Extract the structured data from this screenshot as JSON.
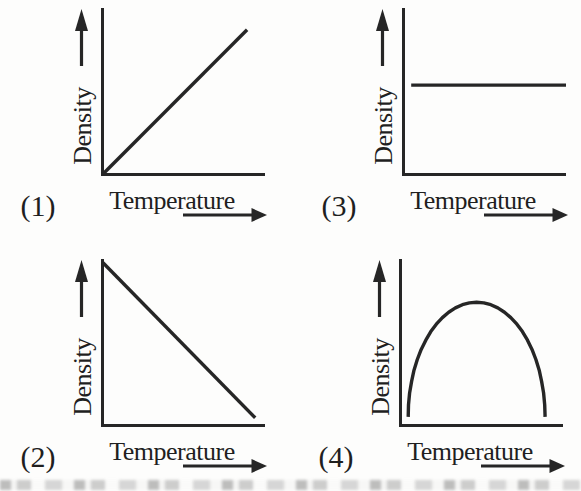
{
  "figure": {
    "title": "",
    "ink_color": "#262626",
    "paper_color": "#fdfdfc",
    "axes_have_tick_labels": false
  },
  "chart_data": [
    {
      "id": 1,
      "label": "(1)",
      "type": "line",
      "xlabel": "Temperature",
      "ylabel": "Density",
      "trend": "linear increasing from origin",
      "x_range": [
        0,
        1
      ],
      "y_range": [
        0,
        1
      ],
      "points": [
        [
          0.006,
          0.006
        ],
        [
          0.89,
          0.88
        ]
      ]
    },
    {
      "id": 2,
      "label": "(2)",
      "type": "line",
      "xlabel": "Temperature",
      "ylabel": "Density",
      "trend": "linear decreasing from maximum at left",
      "x_range": [
        0,
        1
      ],
      "y_range": [
        0,
        1
      ],
      "points": [
        [
          0.006,
          0.99
        ],
        [
          0.94,
          0.05
        ]
      ]
    },
    {
      "id": 3,
      "label": "(3)",
      "type": "line",
      "xlabel": "Temperature",
      "ylabel": "Density",
      "trend": "constant (horizontal line)",
      "x_range": [
        0,
        1
      ],
      "y_range": [
        0,
        1
      ],
      "points": [
        [
          0.05,
          0.545
        ],
        [
          1.0,
          0.545
        ]
      ]
    },
    {
      "id": 4,
      "label": "(4)",
      "type": "line",
      "xlabel": "Temperature",
      "ylabel": "Density",
      "trend": "rises to a maximum then falls (dome / semi-ellipse)",
      "x_range": [
        0,
        1
      ],
      "y_range": [
        0,
        1
      ],
      "points": [
        [
          0.05,
          0.055
        ],
        [
          0.052,
          0.128
        ],
        [
          0.059,
          0.2
        ],
        [
          0.071,
          0.27
        ],
        [
          0.086,
          0.338
        ],
        [
          0.106,
          0.403
        ],
        [
          0.13,
          0.464
        ],
        [
          0.158,
          0.52
        ],
        [
          0.189,
          0.572
        ],
        [
          0.223,
          0.617
        ],
        [
          0.26,
          0.657
        ],
        [
          0.299,
          0.69
        ],
        [
          0.34,
          0.716
        ],
        [
          0.383,
          0.735
        ],
        [
          0.426,
          0.746
        ],
        [
          0.47,
          0.75
        ],
        [
          0.514,
          0.746
        ],
        [
          0.557,
          0.735
        ],
        [
          0.6,
          0.716
        ],
        [
          0.641,
          0.69
        ],
        [
          0.68,
          0.657
        ],
        [
          0.717,
          0.617
        ],
        [
          0.751,
          0.572
        ],
        [
          0.782,
          0.52
        ],
        [
          0.81,
          0.464
        ],
        [
          0.834,
          0.403
        ],
        [
          0.854,
          0.338
        ],
        [
          0.869,
          0.27
        ],
        [
          0.881,
          0.2
        ],
        [
          0.888,
          0.128
        ],
        [
          0.89,
          0.055
        ]
      ]
    }
  ]
}
